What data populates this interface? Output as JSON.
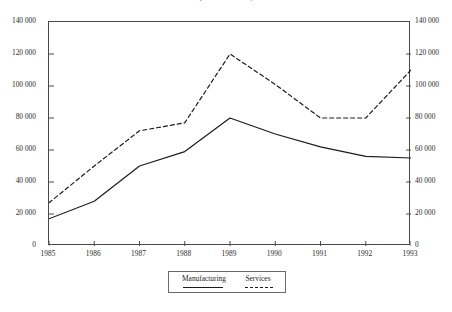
{
  "chart_data": {
    "type": "line",
    "title": "(ECU million)",
    "xlabel": "",
    "ylabel": "",
    "x": [
      1985,
      1986,
      1987,
      1988,
      1989,
      1990,
      1991,
      1992,
      1993
    ],
    "categories": [
      "1985",
      "1986",
      "1987",
      "1988",
      "1989",
      "1990",
      "1991",
      "1992",
      "1993"
    ],
    "series": [
      {
        "name": "Manufacturing",
        "style": "solid",
        "color": "#1c1c1c",
        "values": [
          17000,
          28000,
          50000,
          59000,
          80000,
          70000,
          62000,
          56000,
          55000
        ]
      },
      {
        "name": "Services",
        "style": "dashed",
        "color": "#1c1c1c",
        "values": [
          27000,
          50000,
          72000,
          77000,
          120000,
          101000,
          80000,
          80000,
          110000
        ]
      }
    ],
    "ylim": [
      0,
      140000
    ],
    "xlim": [
      1985,
      1993
    ],
    "yticks": [
      0,
      20000,
      40000,
      60000,
      80000,
      100000,
      120000,
      140000
    ],
    "ytick_labels": [
      "0",
      "20 000",
      "40 000",
      "60 000",
      "80 000",
      "100 000",
      "120 000",
      "140 000"
    ],
    "ytick_labels_right": [
      "0",
      "20 000",
      "40 000",
      "60 000",
      "80 000",
      "100 000",
      "120 000",
      "140 000"
    ],
    "grid": false,
    "dual_axis": true,
    "legend_position": "bottom-center",
    "legend_entries": [
      {
        "label": "Manufacturing",
        "style": "solid"
      },
      {
        "label": "Services",
        "style": "dashed"
      }
    ]
  }
}
